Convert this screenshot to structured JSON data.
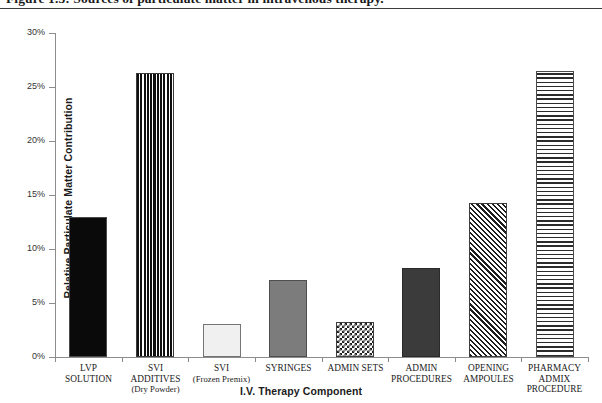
{
  "figure": {
    "caption": "Figure 1.3: Sources of particulate matter in intravenous therapy."
  },
  "chart_data": {
    "type": "bar",
    "title": "Figure 1.3: Sources of particulate matter in intravenous therapy.",
    "xlabel": "I.V. Therapy Component",
    "ylabel": "Relative Particulate Matter Contribution",
    "ylim": [
      0,
      30
    ],
    "ytick_labels": [
      "0%",
      "5%",
      "10%",
      "15%",
      "20%",
      "25%",
      "30%"
    ],
    "ytick_values": [
      0,
      5,
      10,
      15,
      20,
      25,
      30
    ],
    "grid": false,
    "legend": "none",
    "categories": [
      "LVP SOLUTION",
      "SVI ADDITIVES (Dry Powder)",
      "SVI (Frozen Premix)",
      "SYRINGES",
      "ADMIN SETS",
      "ADMIN PROCEDURES",
      "OPENING AMPOULES",
      "PHARMACY ADMIX PROCEDURE"
    ],
    "values": [
      13.0,
      26.3,
      3.1,
      7.1,
      3.2,
      8.2,
      14.3,
      26.5
    ],
    "bars": [
      {
        "label_line1": "LVP",
        "label_line2": "SOLUTION",
        "label_line3": "",
        "value": 13.0,
        "value_text": "13%",
        "pattern": "solid-black"
      },
      {
        "label_line1": "SVI",
        "label_line2": "ADDITIVES",
        "label_line3": "(Dry Powder)",
        "value": 26.3,
        "value_text": "26.3%",
        "pattern": "vertical-stripes"
      },
      {
        "label_line1": "SVI",
        "label_line2": "(Frozen Premix)",
        "label_line3": "",
        "value": 3.1,
        "value_text": "3.1%",
        "pattern": "light-gray"
      },
      {
        "label_line1": "SYRINGES",
        "label_line2": "",
        "label_line3": "",
        "value": 7.1,
        "value_text": "7.1%",
        "pattern": "medium-gray"
      },
      {
        "label_line1": "ADMIN SETS",
        "label_line2": "",
        "label_line3": "",
        "value": 3.2,
        "value_text": "3.2%",
        "pattern": "checkerboard"
      },
      {
        "label_line1": "ADMIN",
        "label_line2": "PROCEDURES",
        "label_line3": "",
        "value": 8.2,
        "value_text": "8.2%",
        "pattern": "dark-gray"
      },
      {
        "label_line1": "OPENING",
        "label_line2": "AMPOULES",
        "label_line3": "",
        "value": 14.3,
        "value_text": "14.3%",
        "pattern": "diagonal-hatch"
      },
      {
        "label_line1": "PHARMACY",
        "label_line2": "ADMIX",
        "label_line3": "PROCEDURE",
        "value": 26.5,
        "value_text": "26.5%",
        "pattern": "horizontal-stripes"
      }
    ],
    "colors": {
      "axis": "#8c8c8c",
      "text": "#1b1b1b",
      "background": "#ffffff",
      "rule": "#3a3a3a"
    }
  }
}
